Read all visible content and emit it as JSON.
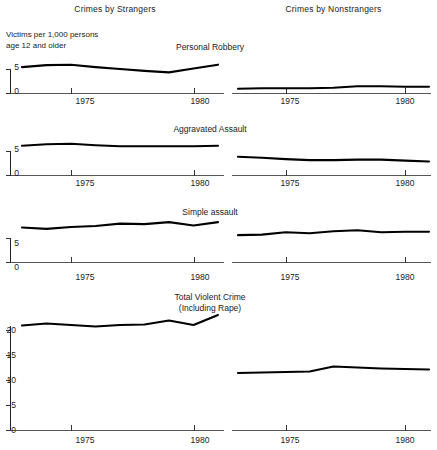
{
  "header": {
    "left_column_title": "Crimes by Strangers",
    "right_column_title": "Crimes by Nonstrangers"
  },
  "axis_note": "Victims per 1,000 persons\nage 12 and older",
  "panel_titles": {
    "robbery": "Personal Robbery",
    "aggravated": "Aggravated Assault",
    "simple": "Simple assault",
    "total": "Total Violent Crime\n(Including Rape)"
  },
  "axis_labels": {
    "x_1975": "1975",
    "x_1980": "1980",
    "y_0": "0",
    "y_5": "5",
    "y_10": "10",
    "y_15": "15",
    "y_20": "20"
  },
  "chart_data": [
    {
      "type": "line",
      "title": "Personal Robbery",
      "series_name": "Crimes by Strangers",
      "xlabel": "",
      "ylabel": "Victims per 1,000 persons age 12 and older",
      "x": [
        1973,
        1974,
        1975,
        1976,
        1977,
        1978,
        1979,
        1980,
        1981
      ],
      "values": [
        5.4,
        5.8,
        5.9,
        5.4,
        5.0,
        4.6,
        4.3,
        5.1,
        5.9
      ],
      "ylim": [
        0,
        7.5
      ],
      "yticks": [
        0,
        5
      ],
      "xticks": [
        1975,
        1980
      ],
      "grid": false,
      "legend": "none"
    },
    {
      "type": "line",
      "title": "Personal Robbery",
      "series_name": "Crimes by Nonstrangers",
      "xlabel": "",
      "ylabel": "Victims per 1,000 persons age 12 and older",
      "x": [
        1973,
        1974,
        1975,
        1976,
        1977,
        1978,
        1979,
        1980,
        1981
      ],
      "values": [
        0.9,
        1.0,
        1.0,
        1.0,
        1.1,
        1.4,
        1.4,
        1.3,
        1.3
      ],
      "ylim": [
        0,
        7.5
      ],
      "yticks": [],
      "xticks": [
        1975,
        1980
      ],
      "grid": false,
      "legend": "none"
    },
    {
      "type": "line",
      "title": "Aggravated Assault",
      "series_name": "Crimes by Strangers",
      "xlabel": "",
      "ylabel": "Victims per 1,000 persons age 12 and older",
      "x": [
        1973,
        1974,
        1975,
        1976,
        1977,
        1978,
        1979,
        1980,
        1981
      ],
      "values": [
        6.1,
        6.4,
        6.5,
        6.2,
        6.0,
        6.0,
        6.0,
        6.0,
        6.1
      ],
      "ylim": [
        0,
        7.5
      ],
      "yticks": [
        0,
        5
      ],
      "xticks": [
        1975,
        1980
      ],
      "grid": false,
      "legend": "none"
    },
    {
      "type": "line",
      "title": "Aggravated Assault",
      "series_name": "Crimes by Nonstrangers",
      "xlabel": "",
      "ylabel": "Victims per 1,000 persons age 12 and older",
      "x": [
        1973,
        1974,
        1975,
        1976,
        1977,
        1978,
        1979,
        1980,
        1981
      ],
      "values": [
        3.8,
        3.6,
        3.3,
        3.1,
        3.1,
        3.2,
        3.2,
        3.0,
        2.8
      ],
      "ylim": [
        0,
        7.5
      ],
      "yticks": [],
      "xticks": [
        1975,
        1980
      ],
      "grid": false,
      "legend": "none"
    },
    {
      "type": "line",
      "title": "Simple assault",
      "series_name": "Crimes by Strangers",
      "xlabel": "",
      "ylabel": "Victims per 1,000 persons age 12 and older",
      "x": [
        1973,
        1974,
        1975,
        1976,
        1977,
        1978,
        1979,
        1980,
        1981
      ],
      "values": [
        7.2,
        6.9,
        7.3,
        7.5,
        8.0,
        7.9,
        8.3,
        7.6,
        8.3
      ],
      "ylim": [
        0,
        9.5
      ],
      "yticks": [
        0,
        5
      ],
      "xticks": [
        1975,
        1980
      ],
      "grid": false,
      "legend": "none"
    },
    {
      "type": "line",
      "title": "Simple assault",
      "series_name": "Crimes by Nonstrangers",
      "xlabel": "",
      "ylabel": "Victims per 1,000 persons age 12 and older",
      "x": [
        1973,
        1974,
        1975,
        1976,
        1977,
        1978,
        1979,
        1980,
        1981
      ],
      "values": [
        5.6,
        5.7,
        6.2,
        6.0,
        6.4,
        6.6,
        6.2,
        6.3,
        6.3
      ],
      "ylim": [
        0,
        9.5
      ],
      "yticks": [],
      "xticks": [
        1975,
        1980
      ],
      "grid": false,
      "legend": "none"
    },
    {
      "type": "line",
      "title": "Total Violent Crime (Including Rape)",
      "series_name": "Crimes by Strangers",
      "xlabel": "",
      "ylabel": "Victims per 1,000 persons age 12 and older",
      "x": [
        1973,
        1974,
        1975,
        1976,
        1977,
        1978,
        1979,
        1980,
        1981
      ],
      "values": [
        20.9,
        21.3,
        21.0,
        20.7,
        21.0,
        21.1,
        21.9,
        21.0,
        23.0
      ],
      "ylim": [
        0,
        25
      ],
      "yticks": [
        0,
        5,
        10,
        15,
        20
      ],
      "xticks": [
        1975,
        1980
      ],
      "grid": false,
      "legend": "none"
    },
    {
      "type": "line",
      "title": "Total Violent Crime (Including Rape)",
      "series_name": "Crimes by Nonstrangers",
      "xlabel": "",
      "ylabel": "Victims per 1,000 persons age 12 and older",
      "x": [
        1973,
        1974,
        1975,
        1976,
        1977,
        1978,
        1979,
        1980,
        1981
      ],
      "values": [
        11.4,
        11.5,
        11.6,
        11.7,
        12.7,
        12.5,
        12.3,
        12.2,
        12.1
      ],
      "ylim": [
        0,
        25
      ],
      "yticks": [
        0,
        5,
        10,
        15,
        20
      ],
      "xticks": [
        1975,
        1980
      ],
      "grid": false,
      "legend": "none"
    }
  ]
}
